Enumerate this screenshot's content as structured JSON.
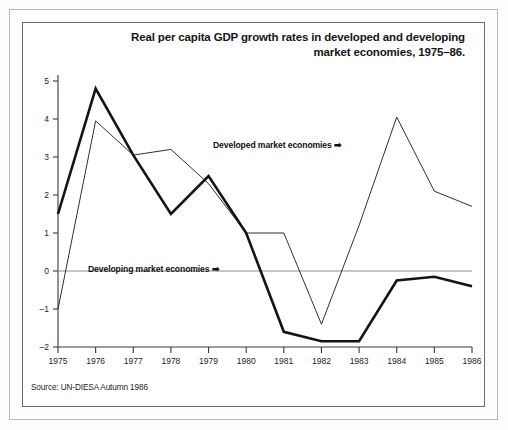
{
  "figure": {
    "title_line1": "Real per capita GDP growth rates in developed and developing",
    "title_line2": "market economies, 1975–86.",
    "source": "Source: UN-DIESA Autumn 1986",
    "background_color": "#ffffff",
    "frame_color": "#6d6d6d"
  },
  "annotations": {
    "developed": "Developed market economies ➡",
    "developing": "Developing market economies ➡"
  },
  "chart_data": {
    "type": "line",
    "title": "Real per capita GDP growth rates in developed and developing market economies, 1975–86.",
    "xlabel": "",
    "ylabel": "",
    "x": [
      1975,
      1976,
      1977,
      1978,
      1979,
      1980,
      1981,
      1982,
      1983,
      1984,
      1985,
      1986
    ],
    "categories": [
      "1975",
      "1976",
      "1977",
      "1978",
      "1979",
      "1980",
      "1981",
      "1982",
      "1983",
      "1984",
      "1985",
      "1986"
    ],
    "xlim": [
      1975,
      1986
    ],
    "ylim": [
      -2,
      5
    ],
    "yticks": [
      -2,
      -1,
      0,
      1,
      2,
      3,
      4,
      5
    ],
    "yticklabels": [
      "–2",
      "–1",
      "0",
      "1",
      "2",
      "3",
      "4",
      "5"
    ],
    "grid": false,
    "zero_line": true,
    "legend": "annotations-inline",
    "series": [
      {
        "name": "Developed market economies",
        "style": "thin",
        "color": "#1a1a1a",
        "linewidth": 0.9,
        "values": [
          -1.0,
          3.95,
          3.05,
          3.2,
          2.3,
          1.0,
          1.0,
          -1.4,
          1.2,
          4.05,
          2.1,
          1.7
        ]
      },
      {
        "name": "Developing market economies",
        "style": "thick",
        "color": "#141414",
        "linewidth": 2.6,
        "values": [
          1.5,
          4.8,
          3.05,
          1.5,
          2.5,
          1.0,
          -1.6,
          -1.85,
          -1.85,
          -0.25,
          -0.15,
          -0.4
        ]
      }
    ]
  }
}
